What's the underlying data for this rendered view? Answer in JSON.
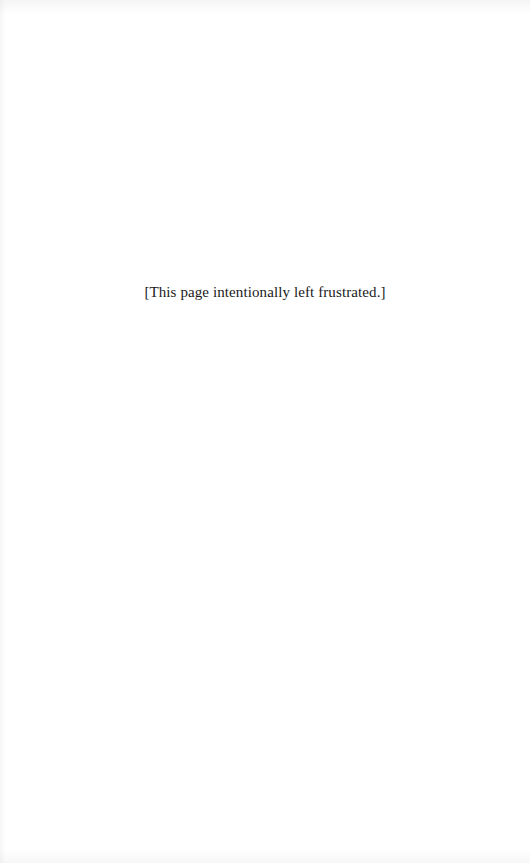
{
  "page": {
    "notice_text": "[This page intentionally left frustrated.]",
    "background_color": "#ffffff",
    "text_color": "#1a1a1a"
  }
}
